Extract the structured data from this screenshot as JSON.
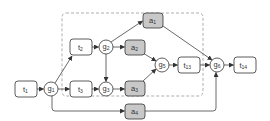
{
  "colors": {
    "stroke": "#333333",
    "edge": "#444444",
    "task_fill": "#ffffff",
    "activity_fill": "#c8c8c8",
    "dashed_box": "#999999"
  },
  "nodes": {
    "t1": {
      "base": "t",
      "sub": "1"
    },
    "t2": {
      "base": "t",
      "sub": "2"
    },
    "t3": {
      "base": "t",
      "sub": "3"
    },
    "t13": {
      "base": "t",
      "sub": "13"
    },
    "t14": {
      "base": "t",
      "sub": "14"
    },
    "g1": {
      "base": "g",
      "sub": "1"
    },
    "g2": {
      "base": "g",
      "sub": "2"
    },
    "g3": {
      "base": "g",
      "sub": "3"
    },
    "g5": {
      "base": "g",
      "sub": "5"
    },
    "g6": {
      "base": "g",
      "sub": "6"
    },
    "a1": {
      "base": "a",
      "sub": "1"
    },
    "a2": {
      "base": "a",
      "sub": "2"
    },
    "a3": {
      "base": "a",
      "sub": "3"
    },
    "a4": {
      "base": "a",
      "sub": "4"
    }
  },
  "edges": [
    [
      "t1",
      "g1"
    ],
    [
      "g1",
      "t2"
    ],
    [
      "g1",
      "t3"
    ],
    [
      "g1",
      "a4"
    ],
    [
      "t2",
      "g2"
    ],
    [
      "g2",
      "a2"
    ],
    [
      "g2",
      "a1"
    ],
    [
      "g2",
      "g3"
    ],
    [
      "t3",
      "g3"
    ],
    [
      "g3",
      "a3"
    ],
    [
      "a2",
      "g5"
    ],
    [
      "a3",
      "g5"
    ],
    [
      "g5",
      "t13"
    ],
    [
      "a1",
      "g6"
    ],
    [
      "t13",
      "g6"
    ],
    [
      "a4",
      "g6"
    ],
    [
      "g6",
      "t14"
    ]
  ]
}
